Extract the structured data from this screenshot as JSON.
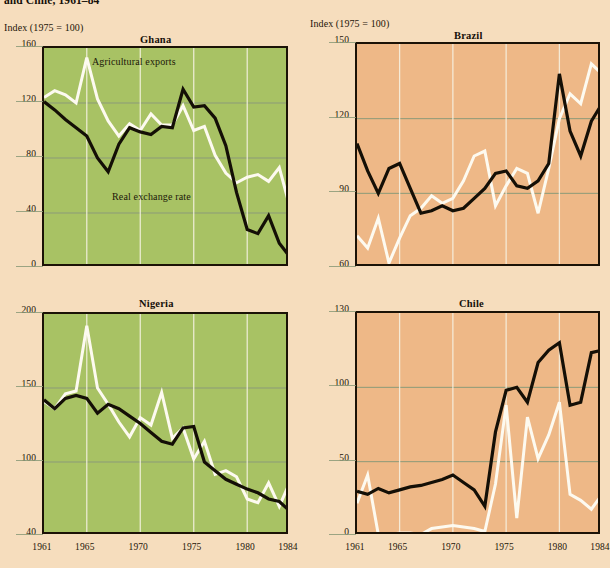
{
  "figure": {
    "title": "and Chile, 1961–84",
    "axis_note": "Index (1975 = 100)",
    "colors": {
      "page_background": "#f6ddbd",
      "green_panel": "#a8c264",
      "orange_panel": "#eeb887",
      "real_exchange_rate_line": "#140f06",
      "agricultural_exports_line": "#fdfaf0",
      "gridline": "#8b9a78",
      "frame": "#1b1206"
    },
    "series_labels": {
      "agricultural_exports": "Agricultural exports",
      "real_exchange_rate": "Real exchange rate"
    }
  },
  "chart_data": [
    {
      "type": "line",
      "title": "Ghana",
      "panel_color": "#a8c264",
      "xlabel": "",
      "ylabel": "Index (1975 = 100)",
      "xlim": [
        1961,
        1984
      ],
      "ylim": [
        0,
        160
      ],
      "yticks": [
        0,
        40,
        80,
        120,
        160
      ],
      "xticks": [
        1961,
        1965,
        1970,
        1975,
        1980,
        1984
      ],
      "grid": true,
      "legend": "inline-annotation",
      "x": [
        1961,
        1962,
        1963,
        1964,
        1965,
        1966,
        1967,
        1968,
        1969,
        1970,
        1971,
        1972,
        1973,
        1974,
        1975,
        1976,
        1977,
        1978,
        1979,
        1980,
        1981,
        1982,
        1983,
        1984
      ],
      "series": [
        {
          "name": "Agricultural exports",
          "color": "#fdfaf0",
          "values": [
            124,
            129,
            126,
            120,
            153,
            123,
            107,
            96,
            105,
            100,
            112,
            104,
            104,
            118,
            100,
            103,
            82,
            69,
            62,
            66,
            68,
            63,
            73,
            44
          ]
        },
        {
          "name": "Real exchange rate",
          "color": "#140f06",
          "values": [
            121,
            115,
            108,
            102,
            96,
            80,
            70,
            90,
            102,
            99,
            97,
            103,
            102,
            130,
            117,
            118,
            109,
            89,
            55,
            28,
            25,
            38,
            18,
            8,
            41
          ]
        }
      ]
    },
    {
      "type": "line",
      "title": "Brazil",
      "panel_color": "#eeb887",
      "xlabel": "",
      "ylabel": "Index (1975 = 100)",
      "xlim": [
        1961,
        1984
      ],
      "ylim": [
        60,
        150
      ],
      "yticks": [
        60,
        90,
        120,
        150
      ],
      "xticks": [
        1961,
        1965,
        1970,
        1975,
        1980,
        1984
      ],
      "grid": true,
      "legend": "inline-annotation",
      "x": [
        1961,
        1962,
        1963,
        1964,
        1965,
        1966,
        1967,
        1968,
        1969,
        1970,
        1971,
        1972,
        1973,
        1974,
        1975,
        1976,
        1977,
        1978,
        1979,
        1980,
        1981,
        1982,
        1983,
        1984
      ],
      "series": [
        {
          "name": "Agricultural exports",
          "color": "#fdfaf0",
          "values": [
            73,
            68,
            80,
            62,
            72,
            81,
            84,
            89,
            86,
            88,
            95,
            105,
            107,
            85,
            93,
            100,
            98,
            82,
            100,
            120,
            130,
            126,
            142,
            138
          ]
        },
        {
          "name": "Real exchange rate",
          "color": "#140f06",
          "values": [
            110,
            99,
            90,
            100,
            102,
            92,
            82,
            83,
            85,
            83,
            84,
            88,
            92,
            98,
            99,
            93,
            92,
            95,
            102,
            138,
            115,
            105,
            119,
            126
          ]
        }
      ]
    },
    {
      "type": "line",
      "title": "Nigeria",
      "panel_color": "#a8c264",
      "xlabel": "",
      "ylabel": "Index (1975 = 100)",
      "xlim": [
        1961,
        1984
      ],
      "ylim": [
        40,
        200
      ],
      "yticks": [
        40,
        100,
        150,
        200
      ],
      "xticks": [
        1961,
        1965,
        1970,
        1975,
        1980,
        1984
      ],
      "grid": true,
      "legend": "inline-annotation",
      "x": [
        1961,
        1962,
        1963,
        1964,
        1965,
        1966,
        1967,
        1968,
        1969,
        1970,
        1971,
        1972,
        1973,
        1974,
        1975,
        1976,
        1977,
        1978,
        1979,
        1980,
        1981,
        1982,
        1983,
        1984
      ],
      "series": [
        {
          "name": "Agricultural exports",
          "color": "#fdfaf0",
          "values": [
            141,
            136,
            146,
            148,
            192,
            150,
            139,
            127,
            117,
            130,
            125,
            147,
            116,
            123,
            102,
            114,
            90,
            93,
            88,
            70,
            67,
            83,
            64,
            84,
            48
          ]
        },
        {
          "name": "Real exchange rate",
          "color": "#140f06",
          "values": [
            142,
            136,
            143,
            145,
            143,
            133,
            139,
            136,
            131,
            126,
            120,
            114,
            112,
            123,
            124,
            100,
            93,
            86,
            82,
            78,
            75,
            70,
            68,
            60,
            40
          ]
        }
      ]
    },
    {
      "type": "line",
      "title": "Chile",
      "panel_color": "#eeb887",
      "xlabel": "",
      "ylabel": "Index (1975 = 100)",
      "xlim": [
        1961,
        1984
      ],
      "ylim": [
        0,
        130
      ],
      "yticks": [
        0,
        50,
        100,
        130
      ],
      "xticks": [
        1961,
        1965,
        1970,
        1975,
        1980,
        1984
      ],
      "grid": true,
      "legend": "inline-annotation",
      "x": [
        1961,
        1962,
        1963,
        1964,
        1965,
        1966,
        1967,
        1968,
        1969,
        1970,
        1971,
        1972,
        1973,
        1974,
        1975,
        1976,
        1977,
        1978,
        1979,
        1980,
        1981,
        1982,
        1983,
        1984
      ],
      "series": [
        {
          "name": "Agricultural exports",
          "color": "#fdfaf0",
          "values": [
            22,
            41,
            1,
            1,
            2,
            2,
            1,
            5,
            6,
            7,
            6,
            5,
            3,
            35,
            88,
            12,
            80,
            52,
            68,
            90,
            28,
            24,
            18,
            28
          ]
        },
        {
          "name": "Real exchange rate",
          "color": "#140f06",
          "values": [
            30,
            28,
            32,
            29,
            31,
            33,
            34,
            36,
            38,
            41,
            36,
            31,
            20,
            70,
            98,
            100,
            90,
            110,
            115,
            118,
            88,
            90,
            114,
            115
          ]
        }
      ]
    }
  ]
}
